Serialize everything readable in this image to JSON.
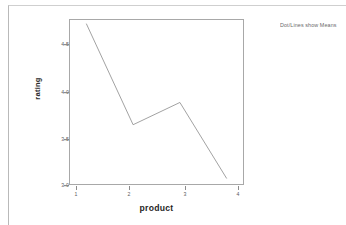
{
  "document": {
    "panel_background": "#ffffff",
    "border_color": "#b9b9b9"
  },
  "chart_note": "Dot/Lines show Means",
  "chart_data": {
    "type": "line",
    "title": "",
    "subtitle": "",
    "xlabel": "product",
    "ylabel": "rating",
    "x": [
      1,
      2,
      3,
      4
    ],
    "values": [
      4.67,
      3.58,
      3.82,
      3.0
    ],
    "xticklabels": [
      "1",
      "2",
      "3",
      "4"
    ],
    "yticklabels": [
      "3.0",
      "3.5",
      "4.0",
      "4.5"
    ],
    "yticks": [
      3.0,
      3.5,
      4.0,
      4.5
    ],
    "xlim": [
      0.63,
      4.37
    ],
    "ylim": [
      2.93,
      4.72
    ],
    "grid": false,
    "legend": "none",
    "line_color": "#8a8a8a",
    "annotation": "Dot/Lines show Means",
    "series": [
      {
        "name": "Mean rating",
        "values": [
          4.67,
          3.58,
          3.82,
          3.0
        ]
      }
    ]
  }
}
